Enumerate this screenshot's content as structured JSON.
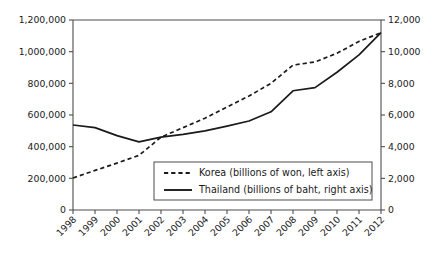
{
  "chart_data": {
    "type": "line",
    "title": "",
    "subtitle": "",
    "xlabel": "",
    "ylabel": "",
    "grid": false,
    "legend_position": "inside-bottom-center",
    "categories": [
      "1998",
      "1999",
      "2000",
      "2001",
      "2002",
      "2003",
      "2004",
      "2005",
      "2006",
      "2007",
      "2008",
      "2009",
      "2010",
      "2011",
      "2012"
    ],
    "axes": {
      "left": {
        "label": "billions of won",
        "ylim": [
          0,
          1200000
        ],
        "ticks": [
          0,
          200000,
          400000,
          600000,
          800000,
          1000000,
          1200000
        ],
        "tick_labels": [
          "0",
          "200,000",
          "400,000",
          "600,000",
          "800,000",
          "1,000,000",
          "1,200,000"
        ]
      },
      "right": {
        "label": "billions of baht",
        "ylim": [
          0,
          12000
        ],
        "ticks": [
          0,
          2000,
          4000,
          6000,
          8000,
          10000,
          12000
        ],
        "tick_labels": [
          "0",
          "2,000",
          "4,000",
          "6,000",
          "8,000",
          "10,000",
          "12,000"
        ]
      }
    },
    "series": [
      {
        "name": "Korea (billions of won, left axis)",
        "short_name": "Korea",
        "axis": "left",
        "style": "dashed",
        "values": [
          202000,
          250000,
          296000,
          345000,
          460000,
          520000,
          580000,
          650000,
          720000,
          800000,
          915000,
          935000,
          990000,
          1065000,
          1120000
        ]
      },
      {
        "name": "Thailand (billions of baht, right axis)",
        "short_name": "Thailand",
        "axis": "right",
        "style": "solid",
        "values": [
          5370,
          5200,
          4700,
          4300,
          4600,
          4780,
          5000,
          5300,
          5620,
          6200,
          7530,
          7730,
          8700,
          9800,
          11200
        ]
      }
    ],
    "legend": [
      {
        "label": "Korea (billions of won, left axis)",
        "style": "dashed"
      },
      {
        "label": "Thailand (billions of baht, right axis)",
        "style": "solid"
      }
    ]
  }
}
